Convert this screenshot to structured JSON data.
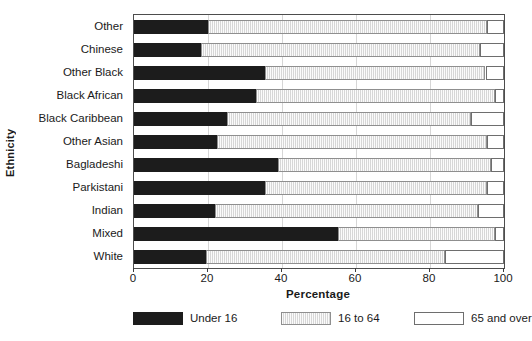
{
  "chart_data": {
    "type": "bar",
    "orientation": "horizontal",
    "stacked": true,
    "title": "",
    "xlabel": "Percentage",
    "ylabel": "Ethnicity",
    "xlim": [
      0,
      100
    ],
    "xticks": [
      0,
      20,
      40,
      60,
      80,
      100
    ],
    "grid": true,
    "legend_position": "bottom",
    "categories": [
      "Other",
      "Chinese",
      "Other Black",
      "Black African",
      "Black Caribbean",
      "Other Asian",
      "Bagladeshi",
      "Parkistani",
      "Indian",
      "Mixed",
      "White"
    ],
    "series": [
      {
        "name": "Under 16",
        "color": "#1c1c1c",
        "values": [
          20.0,
          18.0,
          35.5,
          33.0,
          25.0,
          22.5,
          39.0,
          35.5,
          22.0,
          55.0,
          19.5
        ]
      },
      {
        "name": "16 to 64",
        "color": "#e2e2e2",
        "values": [
          75.5,
          75.5,
          59.5,
          64.5,
          66.0,
          73.0,
          57.5,
          60.0,
          71.0,
          42.5,
          64.5
        ]
      },
      {
        "name": "65 and over",
        "color": "#ffffff",
        "values": [
          4.5,
          6.5,
          5.0,
          2.5,
          9.0,
          4.5,
          3.5,
          4.5,
          7.0,
          2.5,
          16.0
        ]
      }
    ],
    "cumulative_ends": {
      "under_16": [
        20.0,
        18.0,
        35.5,
        33.0,
        25.0,
        22.5,
        39.0,
        35.5,
        22.0,
        55.0,
        19.5
      ],
      "through_16to64": [
        95.5,
        93.5,
        95.0,
        97.5,
        91.0,
        95.5,
        96.5,
        95.5,
        93.0,
        97.5,
        84.0
      ]
    }
  },
  "axes": {
    "y_title": "Ethnicity",
    "x_title": "Percentage",
    "x_tick_labels": [
      "0",
      "20",
      "40",
      "60",
      "80",
      "100"
    ]
  },
  "legend": {
    "items": [
      {
        "label": "Under 16",
        "swatch": "black-filled-swatch"
      },
      {
        "label": "16 to 64",
        "swatch": "grey-hatched-swatch"
      },
      {
        "label": "65 and over",
        "swatch": "white-outlined-swatch"
      }
    ]
  }
}
